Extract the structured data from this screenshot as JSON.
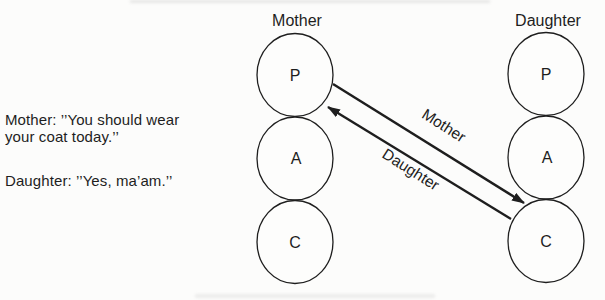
{
  "left_panel": {
    "mother_quote_line1": "Mother: ’’You should wear",
    "mother_quote_line2": "your coat today.’’",
    "daughter_quote": "Daughter: ’’Yes, ma’am.’’"
  },
  "diagram": {
    "mother": {
      "label": "Mother",
      "ego_states": [
        "P",
        "A",
        "C"
      ]
    },
    "daughter": {
      "label": "Daughter",
      "ego_states": [
        "P",
        "A",
        "C"
      ]
    },
    "arrows": [
      {
        "label": "Mother",
        "from": "mother-P",
        "to": "daughter-C"
      },
      {
        "label": "Daughter",
        "from": "daughter-C",
        "to": "mother-P"
      }
    ]
  },
  "colors": {
    "ink": "#1e1e1e",
    "background": "#fcfcfb"
  }
}
